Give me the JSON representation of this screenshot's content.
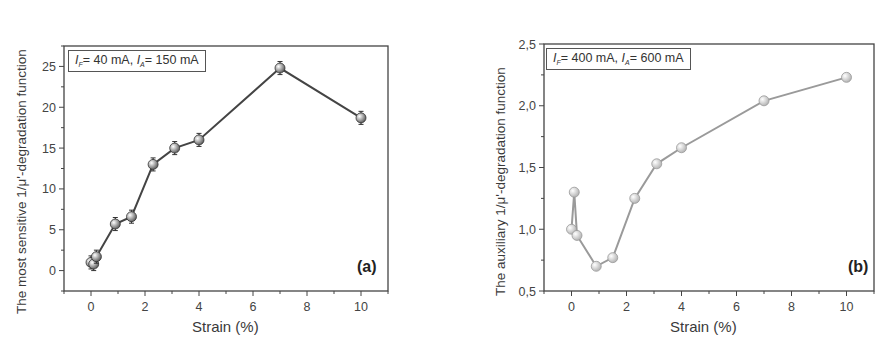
{
  "chart_data": [
    {
      "id": "a",
      "type": "line",
      "panel_label": "(a)",
      "title": "",
      "xlabel": "Strain (%)",
      "ylabel": "The most sensitive 1/μ'-degradation function",
      "legend": {
        "text": "I_F= 40 mA, I_A= 150 mA",
        "I_F_value": "= 40 mA, ",
        "I_A_value": "= 150 mA"
      },
      "xlim": [
        -1,
        11
      ],
      "ylim": [
        -2.5,
        27.5
      ],
      "xticks": [
        0,
        2,
        4,
        6,
        8,
        10
      ],
      "xtick_labels": [
        "0",
        "2",
        "4",
        "6",
        "8",
        "10"
      ],
      "yticks": [
        0,
        5,
        10,
        15,
        20,
        25
      ],
      "ytick_labels": [
        "0",
        "5",
        "10",
        "15",
        "20",
        "25"
      ],
      "grid": false,
      "marker_color": "#555555",
      "line_color": "#444444",
      "error_bars": true,
      "series": [
        {
          "name": "I_F=40 mA, I_A=150 mA",
          "x": [
            0.0,
            0.1,
            0.2,
            0.9,
            1.5,
            2.3,
            3.1,
            4.0,
            7.0,
            10.0
          ],
          "values": [
            1.0,
            0.8,
            1.7,
            5.7,
            6.6,
            13.0,
            15.0,
            16.0,
            24.8,
            18.7
          ],
          "errors": [
            0.8,
            0.8,
            0.8,
            0.8,
            0.8,
            0.8,
            0.8,
            0.8,
            0.8,
            0.8
          ]
        }
      ]
    },
    {
      "id": "b",
      "type": "line",
      "panel_label": "(b)",
      "title": "",
      "xlabel": "Strain (%)",
      "ylabel": "The auxiliary 1/μ'-degradation function",
      "legend": {
        "text": "I_F= 400 mA, I_A= 600 mA",
        "I_F_value": "= 400 mA, ",
        "I_A_value": "= 600 mA"
      },
      "xlim": [
        -1,
        11
      ],
      "ylim": [
        0.5,
        2.5
      ],
      "xticks": [
        0,
        2,
        4,
        6,
        8,
        10
      ],
      "xtick_labels": [
        "0",
        "2",
        "4",
        "6",
        "8",
        "10"
      ],
      "yticks": [
        0.5,
        1.0,
        1.5,
        2.0,
        2.5
      ],
      "ytick_labels": [
        "0,5",
        "1,0",
        "1,5",
        "2,0",
        "2,5"
      ],
      "grid": false,
      "marker_color": "#b0b0b0",
      "line_color": "#9a9a9a",
      "error_bars": false,
      "series": [
        {
          "name": "I_F=400 mA, I_A=600 mA",
          "x": [
            0.0,
            0.1,
            0.2,
            0.9,
            1.5,
            2.3,
            3.1,
            4.0,
            7.0,
            10.0
          ],
          "values": [
            1.0,
            1.3,
            0.95,
            0.7,
            0.77,
            1.25,
            1.53,
            1.66,
            2.04,
            2.23
          ]
        }
      ]
    }
  ]
}
